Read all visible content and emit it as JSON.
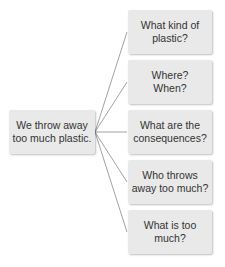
{
  "diagram": {
    "root": {
      "label": "We throw away\ntoo much plastic."
    },
    "branches": [
      {
        "label": "What kind of\nplastic?"
      },
      {
        "label": "Where?\nWhen?"
      },
      {
        "label": "What are the\nconsequences?"
      },
      {
        "label": "Who throws\naway too much?"
      },
      {
        "label": "What is too\nmuch?"
      }
    ],
    "colors": {
      "box": "#e9e9e9",
      "line": "#8a8a8a",
      "text": "#333333"
    }
  }
}
